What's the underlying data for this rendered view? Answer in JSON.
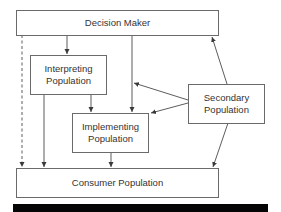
{
  "diagram": {
    "nodes": [
      {
        "id": "decision_maker",
        "label": "Decision Maker"
      },
      {
        "id": "interpreting",
        "label_line1": "Interpreting",
        "label_line2": "Population"
      },
      {
        "id": "implementing",
        "label_line1": "Implementing",
        "label_line2": "Population"
      },
      {
        "id": "secondary",
        "label_line1": "Secondary",
        "label_line2": "Population"
      },
      {
        "id": "consumer",
        "label": "Consumer Population"
      }
    ],
    "edges": [
      {
        "from": "decision_maker",
        "to": "consumer",
        "style": "dashed"
      },
      {
        "from": "decision_maker",
        "to": "interpreting",
        "style": "solid"
      },
      {
        "from": "decision_maker",
        "to": "implementing",
        "style": "solid"
      },
      {
        "from": "interpreting",
        "to": "implementing",
        "style": "solid"
      },
      {
        "from": "interpreting",
        "to": "consumer",
        "style": "solid"
      },
      {
        "from": "implementing",
        "to": "consumer",
        "style": "solid"
      },
      {
        "from": "secondary",
        "to": "decision_maker",
        "style": "solid"
      },
      {
        "from": "secondary",
        "to": "decision_maker_to_implementing_line",
        "style": "solid"
      },
      {
        "from": "secondary",
        "to": "implementing",
        "style": "solid"
      },
      {
        "from": "secondary",
        "to": "consumer",
        "style": "solid"
      }
    ],
    "colors": {
      "line": "#4a4a4a",
      "box_border": "#6a6a6a",
      "text": "#333333",
      "bar": "#050505"
    }
  }
}
